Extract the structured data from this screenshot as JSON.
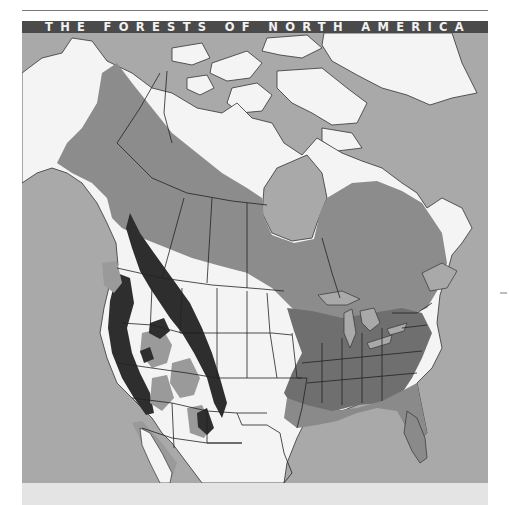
{
  "title": "THE FORESTS OF NORTH AMERICA",
  "map": {
    "subject": "Forest regions of North America",
    "colors": {
      "water": "#a9a9a9",
      "non_forest_land": "#f4f4f4",
      "boreal_and_mixed_forest": "#8c8c8c",
      "eastern_deciduous_forest": "#6f6f6f",
      "western_montane_forest": "#9a9a9a",
      "pacific_and_rocky_mountain_conifer": "#2e2e2e",
      "coastal_plain_forest": "#8a8a8a",
      "boundaries": "#222222",
      "title_banner": "#4a4a4a",
      "bottom_band": "#e4e4e4"
    },
    "regions": [
      "Alaska and northern Canada (boreal forest band)",
      "Canadian Arctic Archipelago",
      "Greenland",
      "Hudson Bay",
      "Great Lakes",
      "Pacific Northwest coastal forest",
      "Rocky Mountain forest",
      "Eastern deciduous forest",
      "Southeastern coastal plain",
      "Great Plains (non-forest)",
      "Southwest desert (non-forest)",
      "Baja California",
      "Florida peninsula"
    ]
  }
}
